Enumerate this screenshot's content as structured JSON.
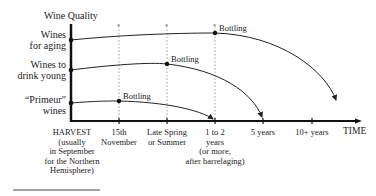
{
  "diagram": {
    "y_axis_title": "Wine Quality",
    "x_axis_title": "TIME",
    "categories": [
      {
        "label_line1": "Wines",
        "label_line2": "for aging",
        "bottling_label": "Bottling"
      },
      {
        "label_line1": "Wines to",
        "label_line2": "drink young",
        "bottling_label": "Bottling"
      },
      {
        "label_line1": "“Primeur”",
        "label_line2": "wines",
        "bottling_label": "Bottling"
      }
    ],
    "time_ticks": [
      {
        "line1": "HARVEST",
        "line2": "(usually",
        "line3": "in September",
        "line4": "for the Northern",
        "line5": "Hemisphere)"
      },
      {
        "line1": "15th",
        "line2": "November"
      },
      {
        "line1": "Late Spring",
        "line2": "or Summer"
      },
      {
        "line1": "1 to 2",
        "line2": "years",
        "line3": "(or more,",
        "line4": "after barrelaging)"
      },
      {
        "line1": "5 years"
      },
      {
        "line1": "10+ years"
      }
    ],
    "colors": {
      "line": "#222222",
      "dotted": "#888888",
      "background": "#ffffff"
    }
  }
}
